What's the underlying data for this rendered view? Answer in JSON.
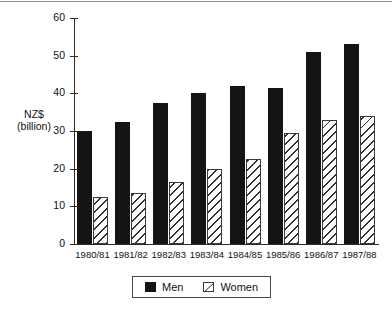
{
  "chart_data": {
    "type": "bar",
    "title": "",
    "subtitle": "",
    "xlabel": "",
    "ylabel": "NZ$\n(billion)",
    "ylabel_lines": [
      "NZ$",
      "(billion)"
    ],
    "categories": [
      "1980/81",
      "1981/82",
      "1982/83",
      "1983/84",
      "1984/85",
      "1985/86",
      "1986/87",
      "1987/88"
    ],
    "series": [
      {
        "name": "Men",
        "values": [
          30,
          32.5,
          37.5,
          40,
          42,
          41.5,
          51,
          53
        ],
        "color": "#141414",
        "pattern": "solid"
      },
      {
        "name": "Women",
        "values": [
          12.5,
          13.5,
          16.5,
          20,
          22.5,
          29.5,
          33,
          34
        ],
        "color": "#ffffff",
        "pattern": "diagonal-hatch"
      }
    ],
    "ylim": [
      0,
      60
    ],
    "yticks": [
      0,
      10,
      20,
      30,
      40,
      50,
      60
    ],
    "ytick_labels": [
      "0",
      "10",
      "20",
      "30",
      "40",
      "50",
      "60"
    ],
    "grid": false,
    "legend_position": "bottom-center",
    "legend_entries": [
      "Men",
      "Women"
    ]
  },
  "legend": {
    "men_label": "Men",
    "women_label": "Women"
  }
}
